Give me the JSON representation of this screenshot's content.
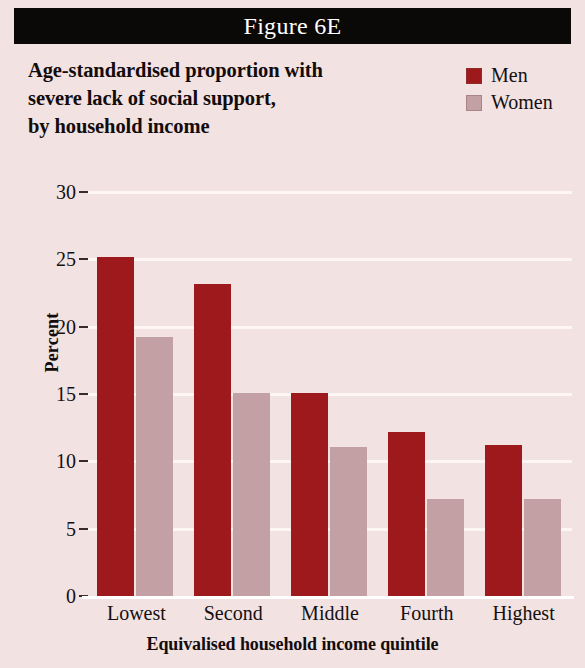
{
  "figure": {
    "banner_label": "Figure 6E",
    "background_color": "#f2e2e2",
    "banner_color": "#0b0808"
  },
  "chart_data": {
    "type": "bar",
    "title": "Age-standardised proportion with severe lack of social support, by household income",
    "title_lines": [
      "Age-standardised proportion with",
      "severe lack of social support,",
      "by household income"
    ],
    "subtitle": "",
    "xlabel": "Equivalised household income quintile",
    "ylabel": "Percent",
    "categories": [
      "Lowest",
      "Second",
      "Middle",
      "Fourth",
      "Highest"
    ],
    "series": [
      {
        "name": "Men",
        "color": "#9d191c",
        "values": [
          25.2,
          23.2,
          15.1,
          12.2,
          11.2
        ]
      },
      {
        "name": "Women",
        "color": "#c3a0a4",
        "values": [
          19.2,
          15.1,
          11.1,
          7.2,
          7.2
        ]
      }
    ],
    "ylim": [
      0,
      30
    ],
    "yticks": [
      0,
      5,
      10,
      15,
      20,
      25,
      30
    ],
    "ytick_labels": [
      "0",
      "5",
      "10",
      "15",
      "20",
      "25",
      "30"
    ],
    "grid": true,
    "grid_color": "#fdf6f5",
    "legend_position": "top-right"
  }
}
